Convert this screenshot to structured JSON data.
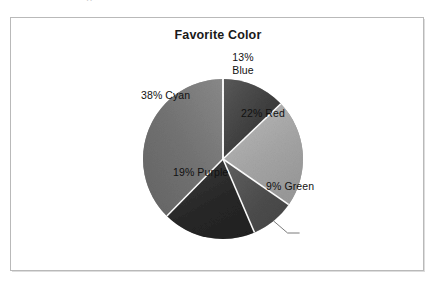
{
  "page": {
    "clipped_top_text": "..",
    "background_color": "#ffffff",
    "frame_border_color": "#b9b9b9"
  },
  "chart_data": {
    "type": "pie",
    "title": "Favorite Color",
    "xlabel": "",
    "ylabel": "",
    "legend": "none",
    "grid": false,
    "rendering": "grayscale",
    "start_angle_deg": 0,
    "direction": "clockwise",
    "categories": [
      "Blue",
      "Red",
      "Green",
      "Purple",
      "Cyan"
    ],
    "values": [
      13,
      22,
      9,
      19,
      38
    ],
    "value_unit": "%",
    "data_labels": [
      "13% Blue",
      "22% Red",
      "9% Green",
      "19% Purple",
      "38% Cyan"
    ],
    "slices": [
      {
        "name": "Blue",
        "value": 13,
        "label_line1": "13%",
        "label_line2": "Blue",
        "label_text": "13% Blue",
        "label_position": "inside",
        "fill_color": "#3f3f3f",
        "fill_color_light": "#5a5a5a"
      },
      {
        "name": "Red",
        "value": 22,
        "label_text": "22% Red",
        "label_position": "inside",
        "fill_color": "#a3a3a3",
        "fill_color_light": "#bdbdbd"
      },
      {
        "name": "Green",
        "value": 9,
        "label_text": "9% Green",
        "label_position": "outside",
        "fill_color": "#4c4c4c",
        "fill_color_light": "#626262"
      },
      {
        "name": "Purple",
        "value": 19,
        "label_text": "19% Purple",
        "label_position": "inside",
        "fill_color": "#262626",
        "fill_color_light": "#3c3c3c"
      },
      {
        "name": "Cyan",
        "value": 38,
        "label_text": "38% Cyan",
        "label_position": "inside",
        "fill_color": "#6e6e6e",
        "fill_color_light": "#878787"
      }
    ],
    "geometry": {
      "center_x": 212,
      "center_y": 141,
      "radius": 80,
      "separator_color": "#ffffff",
      "separator_width": 1.6
    }
  }
}
